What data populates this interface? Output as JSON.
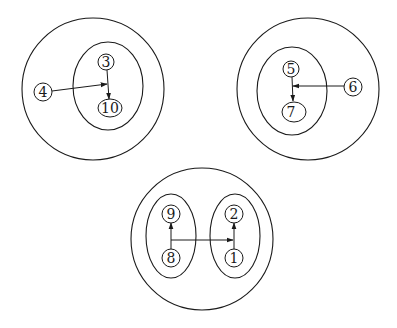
{
  "diagram": {
    "groups": [
      {
        "name": "top-left",
        "nodes": [
          {
            "id": "3",
            "label": "3"
          },
          {
            "id": "10",
            "label": "10"
          },
          {
            "id": "4",
            "label": "4"
          }
        ],
        "edges": [
          {
            "from": "3",
            "to": "10"
          },
          {
            "from": "4",
            "to": "edge 3-10"
          }
        ]
      },
      {
        "name": "top-right",
        "nodes": [
          {
            "id": "5",
            "label": "5"
          },
          {
            "id": "7",
            "label": "7"
          },
          {
            "id": "6",
            "label": "6"
          }
        ],
        "edges": [
          {
            "from": "5",
            "to": "7"
          },
          {
            "from": "6",
            "to": "edge 5-7"
          }
        ]
      },
      {
        "name": "bottom",
        "nodes": [
          {
            "id": "9",
            "label": "9"
          },
          {
            "id": "8",
            "label": "8"
          },
          {
            "id": "2",
            "label": "2"
          },
          {
            "id": "1",
            "label": "1"
          }
        ],
        "edges": [
          {
            "from": "8",
            "to": "9"
          },
          {
            "from": "1",
            "to": "2"
          },
          {
            "from": "edge 8-9",
            "to": "edge 1-2"
          }
        ]
      }
    ]
  },
  "labels": {
    "n3": "3",
    "n10": "10",
    "n4": "4",
    "n5": "5",
    "n7": "7",
    "n6": "6",
    "n9": "9",
    "n8": "8",
    "n2": "2",
    "n1": "1"
  }
}
